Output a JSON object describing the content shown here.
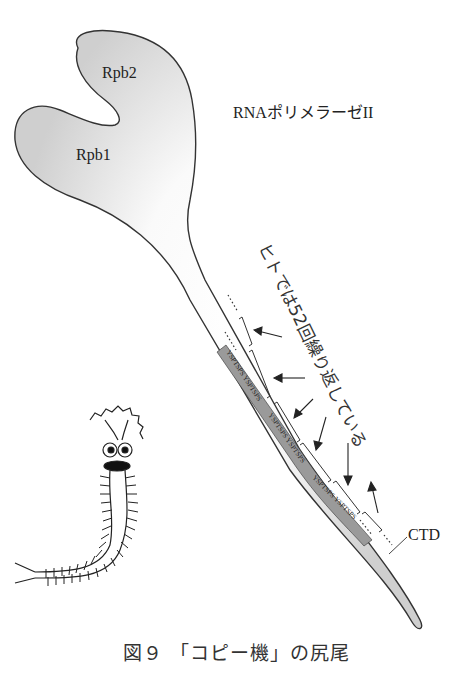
{
  "figure": {
    "caption": "図９ 「コピー機」の尻尾",
    "title_label": "RNAポリメラーゼII",
    "subunits": [
      {
        "name": "Rpb2"
      },
      {
        "name": "Rpb1"
      }
    ],
    "annotation_vertical": "ヒトでは52回繰り返している",
    "ctd_label": "CTD",
    "repeat_unit": "YSPTSPS",
    "colors": {
      "body_fill": "#d8d8d8",
      "body_highlight": "#ffffff",
      "outline": "#333333",
      "repeat_fill": "#9a9a9a"
    }
  }
}
